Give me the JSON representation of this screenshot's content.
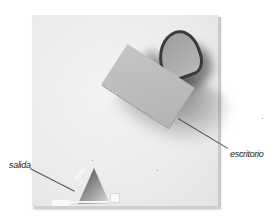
{
  "figure": {
    "labels": {
      "desk": "escritorio",
      "exit": "salida"
    },
    "elements": [
      {
        "name": "desk-block",
        "label_ref": "desk"
      },
      {
        "name": "curved-wall",
        "label_ref": null
      },
      {
        "name": "exit-wedge",
        "label_ref": "exit"
      }
    ],
    "colors": {
      "background": "#ffffff",
      "board": "#ebebeb",
      "desk": "#bdbdbd",
      "arch_rim": "#3a3a3a",
      "leader_line": "#555555",
      "label_text": "#222222"
    }
  }
}
